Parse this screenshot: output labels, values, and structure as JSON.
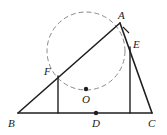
{
  "figure": {
    "type": "geometry-diagram",
    "stroke_color": "#1f1f1f",
    "dashed_color": "#8a8a8a",
    "background": "#ffffff"
  },
  "labels": {
    "A": "A",
    "B": "B",
    "C": "C",
    "D": "D",
    "E": "E",
    "F": "F",
    "O": "O"
  },
  "label_positions": {
    "A": {
      "x": 118,
      "y": 10
    },
    "B": {
      "x": 8,
      "y": 118
    },
    "C": {
      "x": 148,
      "y": 118
    },
    "D": {
      "x": 92,
      "y": 118
    },
    "E": {
      "x": 133,
      "y": 39
    },
    "F": {
      "x": 44,
      "y": 66
    },
    "O": {
      "x": 82,
      "y": 94
    }
  },
  "points": {
    "A": {
      "x": 120,
      "y": 23
    },
    "B": {
      "x": 18,
      "y": 113
    },
    "C": {
      "x": 152,
      "y": 113
    },
    "D": {
      "x": 96,
      "y": 113
    },
    "E": {
      "x": 130,
      "y": 47
    },
    "F": {
      "x": 58,
      "y": 76
    },
    "O": {
      "x": 86,
      "y": 89
    },
    "F_foot": {
      "x": 58,
      "y": 113
    },
    "E_foot": {
      "x": 130,
      "y": 113
    }
  },
  "circle": {
    "cx": 86,
    "cy": 51,
    "r": 39,
    "style": "dashed"
  },
  "segments": [
    {
      "name": "side-BC",
      "from": "B",
      "to": "C"
    },
    {
      "name": "side-BA",
      "from": "B",
      "to": "A"
    },
    {
      "name": "side-AC",
      "from": "A",
      "to": "C"
    },
    {
      "name": "perpendicular-F",
      "from": "F",
      "to": "F_foot"
    },
    {
      "name": "perpendicular-E",
      "from": "E",
      "to": "E_foot"
    }
  ],
  "dot_markers": [
    "O",
    "D"
  ],
  "right_angle_mark_at": "A"
}
